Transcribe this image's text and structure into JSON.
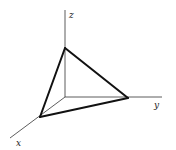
{
  "diagram": {
    "origin": [
      65,
      97
    ],
    "axes": [
      {
        "name": "z",
        "label": "z",
        "end": [
          65,
          10
        ],
        "label_pos": [
          69,
          18
        ]
      },
      {
        "name": "y",
        "label": "y",
        "end": [
          162,
          97
        ],
        "label_pos": [
          154,
          108
        ]
      },
      {
        "name": "x",
        "label": "x",
        "end": [
          10,
          138
        ],
        "label_pos": [
          16,
          146
        ]
      }
    ],
    "vertices": {
      "z_intercept": [
        65,
        48
      ],
      "y_intercept": [
        128,
        98
      ],
      "x_intercept": [
        40,
        117
      ]
    },
    "colors": {
      "axis": "#333333",
      "edge": "#111111",
      "background": "#ffffff"
    }
  }
}
